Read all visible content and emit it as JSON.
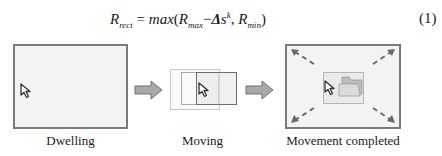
{
  "equation": {
    "lhs_symbol": "R",
    "lhs_sub": "rect",
    "equals": "=",
    "func": "max",
    "open": "(",
    "arg1_symbol": "R",
    "arg1_sub": "max",
    "minus": "−",
    "delta": "Δ",
    "s": "s",
    "exp": "k",
    "comma": ",",
    "arg2_symbol": "R",
    "arg2_sub": "min",
    "close": ")",
    "number": "(1)"
  },
  "stages": [
    {
      "label": "Dwelling",
      "icon": "cursor-arrow-icon"
    },
    {
      "label": "Moving",
      "icon": "cursor-arrow-icon"
    },
    {
      "label": "Movement completed",
      "icon": "folder-icon"
    }
  ],
  "connectors": [
    "right-arrow-icon",
    "right-arrow-icon"
  ],
  "colors": {
    "panel_border": "#7a7a7a",
    "panel_fill": "#f3f3f3",
    "arrow_fill": "#a9a9a9",
    "arrow_stroke": "#707070",
    "folder_fill": "#d8d8d8"
  }
}
